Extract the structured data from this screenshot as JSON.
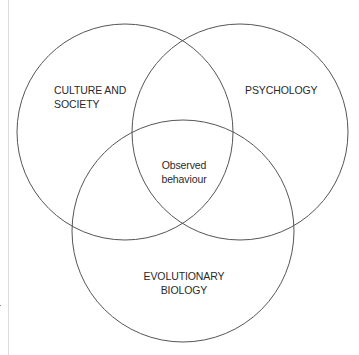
{
  "diagram": {
    "type": "venn",
    "stroke_color": "#555555",
    "circles": [
      {
        "id": "culture",
        "label_lines": [
          "CULTURE AND",
          "SOCIETY"
        ],
        "cx": 125,
        "cy": 132,
        "r": 108
      },
      {
        "id": "psychology",
        "label_lines": [
          "PSYCHOLOGY"
        ],
        "cx": 240,
        "cy": 132,
        "r": 108
      },
      {
        "id": "biology",
        "label_lines": [
          "EVOLUTIONARY",
          "BIOLOGY"
        ],
        "cx": 183,
        "cy": 231,
        "r": 111
      }
    ],
    "intersection": {
      "label_lines": [
        "Observed",
        "behaviour"
      ]
    }
  }
}
